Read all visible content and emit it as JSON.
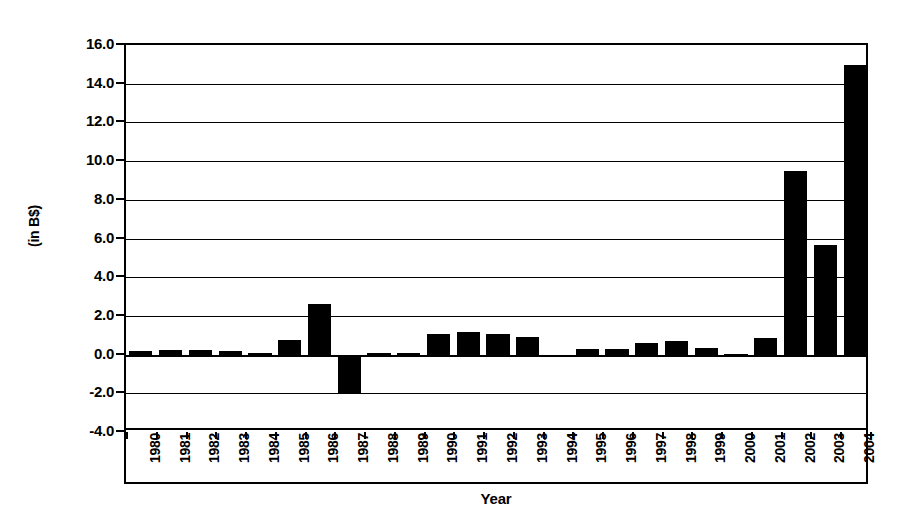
{
  "chart_data": {
    "type": "bar",
    "title": "",
    "xlabel": "Year",
    "ylabel": "(in B$)",
    "ylim": [
      -4.0,
      16.0
    ],
    "ytick_step": 2.0,
    "grid": true,
    "legend": "none",
    "bar_color": "#000000",
    "categories": [
      "1980",
      "1981",
      "1982",
      "1983",
      "1984",
      "1985",
      "1986",
      "1987",
      "1988",
      "1989",
      "1990",
      "1991",
      "1992",
      "1993",
      "1994",
      "1995",
      "1996",
      "1997",
      "1998",
      "1999",
      "2000",
      "2001",
      "2002",
      "2003",
      "2004"
    ],
    "values": [
      0.2,
      0.25,
      0.25,
      0.2,
      0.1,
      0.75,
      2.6,
      -2.0,
      0.1,
      0.1,
      1.05,
      1.15,
      1.05,
      0.9,
      -0.15,
      0.3,
      0.3,
      0.6,
      0.7,
      0.35,
      0.05,
      0.85,
      9.5,
      5.65,
      14.95
    ],
    "ytick_labels": [
      "16.0",
      "14.0",
      "12.0",
      "10.0",
      "8.0",
      "6.0",
      "4.0",
      "2.0",
      "0.0",
      "-2.0",
      "-4.0"
    ],
    "ytick_values": [
      16.0,
      14.0,
      12.0,
      10.0,
      8.0,
      6.0,
      4.0,
      2.0,
      0.0,
      -2.0,
      -4.0
    ]
  }
}
